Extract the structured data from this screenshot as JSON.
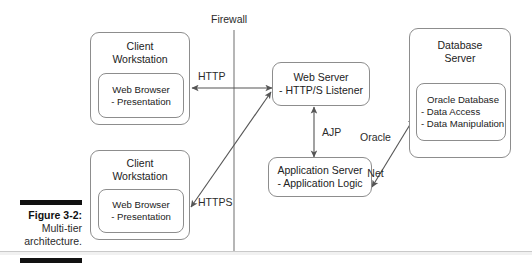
{
  "figure": {
    "caption_number": "Figure 3-2:",
    "caption_line1": "Multi-tier",
    "caption_line2": "architecture."
  },
  "diagram": {
    "type": "architecture-block-diagram",
    "firewall_label": "Firewall",
    "nodes": [
      {
        "id": "client-workstation-http",
        "title_line1": "Client",
        "title_line2": "Workstation",
        "inner_line1": "Web Browser",
        "inner_line2": "- Presentation"
      },
      {
        "id": "client-workstation-https",
        "title_line1": "Client",
        "title_line2": "Workstation",
        "inner_line1": "Web Browser",
        "inner_line2": "- Presentation"
      },
      {
        "id": "web-server",
        "line1": "Web Server",
        "line2": "- HTTP/S Listener"
      },
      {
        "id": "application-server",
        "line1": "Application Server",
        "line2": "- Application Logic"
      },
      {
        "id": "database-server",
        "title_line1": "Database",
        "title_line2": "Server",
        "inner_line1": "Oracle Database",
        "inner_line2": "- Data Access",
        "inner_line3": "- Data Manipulation"
      }
    ],
    "connectors": [
      {
        "id": "http",
        "label": "HTTP",
        "from": "client-workstation-http",
        "to": "web-server",
        "direction": "bidirectional"
      },
      {
        "id": "https",
        "label": "HTTPS",
        "from": "client-workstation-https",
        "to": "web-server",
        "direction": "bidirectional"
      },
      {
        "id": "ajp",
        "label": "AJP",
        "from": "web-server",
        "to": "application-server",
        "direction": "bidirectional"
      },
      {
        "id": "oracle-net",
        "label_line1": "Oracle",
        "label_line2": "Net",
        "from": "application-server",
        "to": "database-server",
        "direction": "bidirectional"
      }
    ],
    "colors": {
      "stroke": "#8d8d8d",
      "arrow": "#555555",
      "text": "#222222",
      "caption_bar": "#111111",
      "background": "#ffffff"
    }
  }
}
